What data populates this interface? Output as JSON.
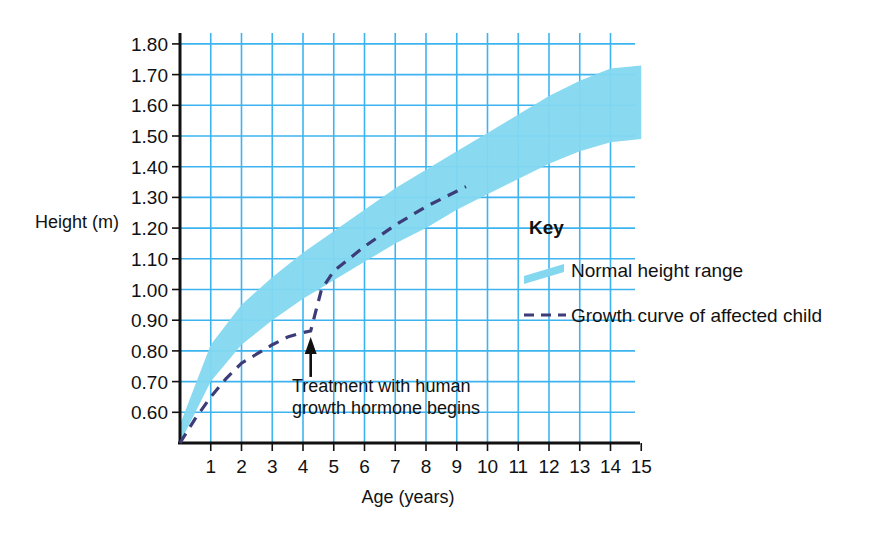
{
  "chart_data": {
    "type": "area",
    "title": "",
    "xlabel": "Age (years)",
    "ylabel": "Height (m)",
    "xlim": [
      0,
      15
    ],
    "ylim": [
      0.5,
      1.8
    ],
    "grid": true,
    "x_ticks": [
      "1",
      "2",
      "3",
      "4",
      "5",
      "6",
      "7",
      "8",
      "9",
      "10",
      "11",
      "12",
      "13",
      "14",
      "15"
    ],
    "y_ticks": [
      "0.60",
      "0.70",
      "0.80",
      "0.90",
      "1.00",
      "1.10",
      "1.20",
      "1.30",
      "1.40",
      "1.50",
      "1.60",
      "1.70",
      "1.80"
    ],
    "series": [
      {
        "name": "Normal height range",
        "type": "band",
        "color": "#83d8f0",
        "x": [
          0,
          1,
          2,
          3,
          4,
          5,
          6,
          7,
          8,
          9,
          10,
          11,
          12,
          13,
          14,
          15
        ],
        "upper": [
          0.56,
          0.82,
          0.95,
          1.04,
          1.12,
          1.19,
          1.26,
          1.33,
          1.39,
          1.45,
          1.51,
          1.57,
          1.63,
          1.68,
          1.72,
          1.73
        ],
        "lower": [
          0.5,
          0.7,
          0.82,
          0.9,
          0.97,
          1.03,
          1.09,
          1.15,
          1.2,
          1.26,
          1.31,
          1.36,
          1.41,
          1.45,
          1.48,
          1.49
        ]
      },
      {
        "name": "Growth curve of affected child",
        "type": "dashed-line",
        "color": "#3c3c78",
        "x": [
          0,
          0.5,
          1,
          1.5,
          2,
          2.5,
          3,
          3.5,
          4,
          4.25,
          4.6,
          5,
          5.5,
          6,
          7,
          8,
          9,
          9.3
        ],
        "y": [
          0.5,
          0.58,
          0.65,
          0.71,
          0.76,
          0.79,
          0.82,
          0.845,
          0.86,
          0.865,
          1.0,
          1.06,
          1.1,
          1.14,
          1.21,
          1.27,
          1.32,
          1.335
        ]
      }
    ],
    "annotations": [
      {
        "name": "treatment-start",
        "text_line1": "Treatment with human",
        "text_line2": "growth hormone begins",
        "arrow_x": 4.25,
        "arrow_y": 0.865
      }
    ],
    "legend": {
      "position": "inside-right",
      "title": "Key",
      "entries": [
        {
          "label": "Normal height range",
          "swatch": "band"
        },
        {
          "label": "Growth curve of affected child",
          "swatch": "dashed-line"
        }
      ]
    },
    "colors": {
      "band": "#83d8f0",
      "grid": "#3db4ef",
      "axis": "#111111",
      "curve": "#3c3c78",
      "background": "#ffffff"
    }
  }
}
